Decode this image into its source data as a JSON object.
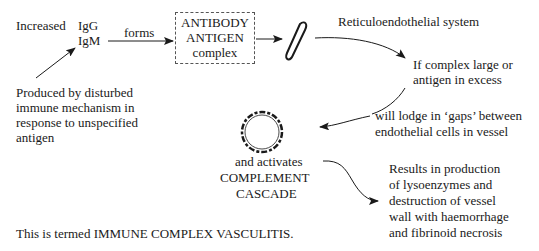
{
  "diagram": {
    "increased": "Increased",
    "igg": "IgG",
    "igm": "IgM",
    "forms": "forms",
    "box": {
      "line1": "ANTIBODY",
      "line2": "ANTIGEN",
      "line3": "complex"
    },
    "produced": [
      "Produced by disturbed",
      "immune mechanism in",
      "response to unspecified",
      "antigen"
    ],
    "res": "Reticuloendothelial system",
    "if_complex": [
      "If complex large or",
      "antigen in excess"
    ],
    "lodge": [
      "will lodge in ‘gaps’ between",
      "endothelial cells in vessel"
    ],
    "activates": [
      "and activates",
      "COMPLEMENT",
      "CASCADE"
    ],
    "results": [
      "Results in production",
      "of lysoenzymes and",
      "destruction of vessel",
      "wall with haemorrhage",
      "and fibrinoid necrosis"
    ],
    "footer": "This is termed IMMUNE COMPLEX VASCULITIS."
  }
}
